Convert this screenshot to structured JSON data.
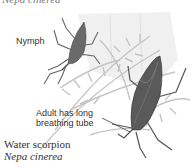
{
  "top_cutoff_text": "Nepa cinerea",
  "labels": {
    "nymph": "Nymph",
    "adult_line1": "Adult has long",
    "adult_line2": "breathing tube"
  },
  "caption": {
    "common_name": "Water scorpion",
    "scientific_name": "Nepa cinerea"
  },
  "colors": {
    "background": "#ffffff",
    "insect_body": "#5a5a5a",
    "plant": "#c8c8c8",
    "text": "#333333"
  }
}
